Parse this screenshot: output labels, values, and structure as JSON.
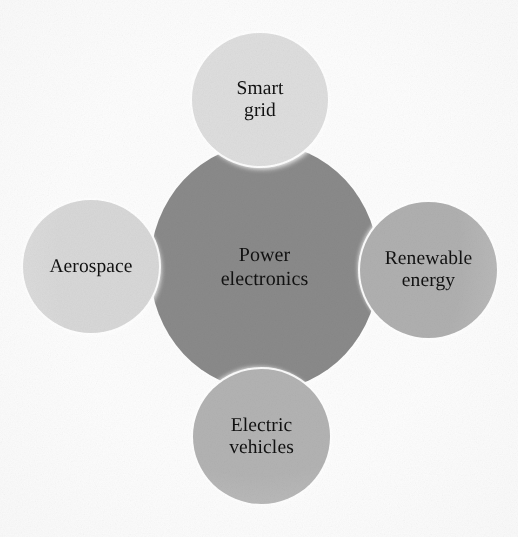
{
  "figure": {
    "type": "hub-and-spoke-diagram",
    "background_color": "#fdfdfd",
    "text_color": "#111111",
    "hub": {
      "id": "power-electronics",
      "label": "Power\nelectronics",
      "label_line_1": "Power",
      "label_line_2": "electronics",
      "fill_color": "#8a8a8a",
      "shape": "circle"
    },
    "satellites": [
      {
        "id": "smart-grid",
        "label": "Smart\ngrid",
        "label_line_1": "Smart",
        "label_line_2": "grid",
        "position": "top",
        "fill_color": "#dedede",
        "shape": "circle"
      },
      {
        "id": "renewable-energy",
        "label": "Renewable\nenergy",
        "label_line_1": "Renewable",
        "label_line_2": "energy",
        "position": "right",
        "fill_color": "#b0b0b0",
        "shape": "circle"
      },
      {
        "id": "electric-vehicles",
        "label": "Electric\nvehicles",
        "label_line_1": "Electric",
        "label_line_2": "vehicles",
        "position": "bottom",
        "fill_color": "#b3b3b3",
        "shape": "circle"
      },
      {
        "id": "aerospace",
        "label": "Aerospace",
        "label_line_1": "Aerospace",
        "label_line_2": "",
        "position": "left",
        "fill_color": "#d8d8d8",
        "shape": "circle"
      }
    ]
  }
}
